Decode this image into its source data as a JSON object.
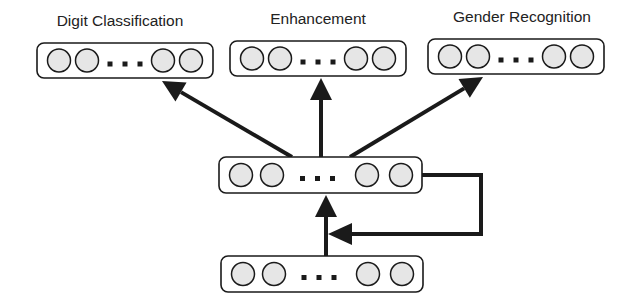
{
  "diagram": {
    "colors": {
      "stroke": "#1a1a1a",
      "node_fill": "#e6e6e6",
      "background": "#ffffff"
    },
    "output_layers": [
      {
        "label": "Digit Classification",
        "x": 37,
        "y": 43,
        "w": 176,
        "h": 35,
        "label_x": 120,
        "label_y": 12
      },
      {
        "label": "Enhancement",
        "x": 230,
        "y": 41,
        "w": 176,
        "h": 35,
        "label_x": 318,
        "label_y": 10
      },
      {
        "label": "Gender Recognition",
        "x": 428,
        "y": 39,
        "w": 176,
        "h": 35,
        "label_x": 522,
        "label_y": 8
      }
    ],
    "hidden_layer": {
      "name": "shared-recurrent-layer",
      "x": 219,
      "y": 157,
      "w": 203,
      "h": 36
    },
    "input_layer": {
      "name": "input-layer",
      "x": 221,
      "y": 256,
      "w": 202,
      "h": 36
    },
    "ellipsis": "..."
  }
}
